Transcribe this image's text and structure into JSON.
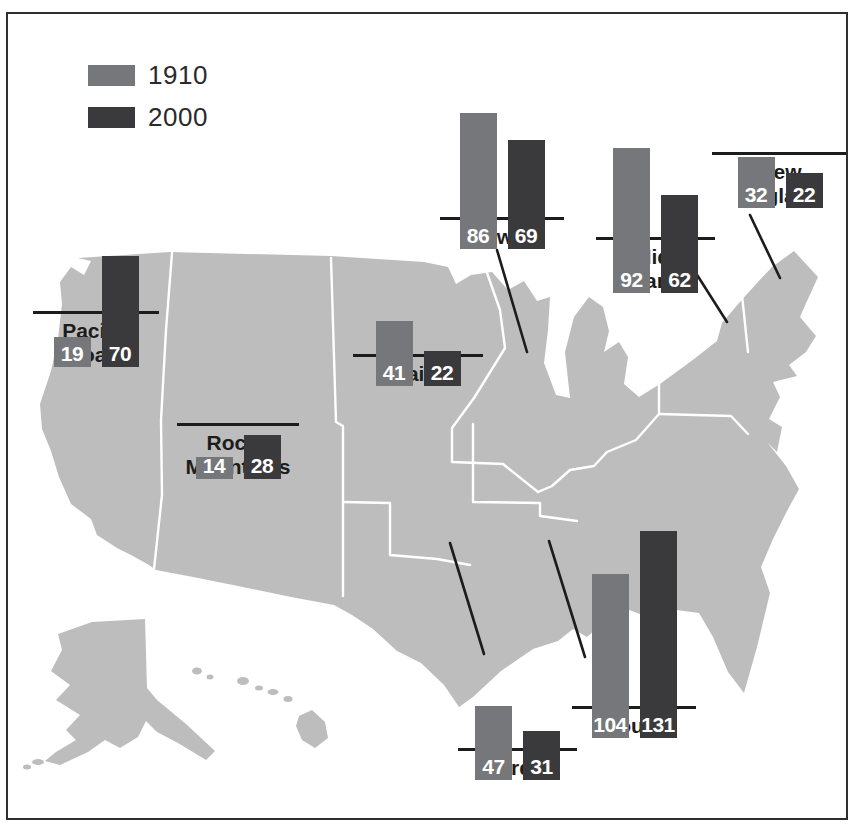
{
  "figure": {
    "kind": "us-regional-map-with-paired-bar-charts",
    "background_color": "#ffffff",
    "frame_color": "#2f2f31"
  },
  "legend": {
    "items": [
      {
        "label": "1910",
        "color": "#76777a"
      },
      {
        "label": "2000",
        "color": "#3a3a3c"
      }
    ]
  },
  "map": {
    "name": "united-states-map",
    "fill_color": "#bdbdbd",
    "region_border_color": "#ffffff",
    "callout_line_color": "#1c1c1c"
  },
  "regions": [
    {
      "id": "pacific",
      "label": "Pacific\nCoast",
      "v1910": 19,
      "v2000": 70
    },
    {
      "id": "rocky",
      "label": "Rocky\nMountains",
      "v1910": 14,
      "v2000": 28
    },
    {
      "id": "plains",
      "label": "Plains",
      "v1910": 41,
      "v2000": 22
    },
    {
      "id": "midwest",
      "label": "Midwest",
      "v1910": 86,
      "v2000": 69
    },
    {
      "id": "midatlantic",
      "label": "Mid-\nAtlantic",
      "v1910": 92,
      "v2000": 62
    },
    {
      "id": "newengland",
      "label": "New\nEngland",
      "v1910": 32,
      "v2000": 22
    },
    {
      "id": "border",
      "label": "Border",
      "v1910": 47,
      "v2000": 31
    },
    {
      "id": "south",
      "label": "South",
      "v1910": 104,
      "v2000": 131
    }
  ],
  "chart_data": {
    "type": "bar",
    "categories": [
      "Pacific Coast",
      "Rocky Mountains",
      "Plains",
      "Midwest",
      "Mid-Atlantic",
      "New England",
      "Border",
      "South"
    ],
    "series": [
      {
        "name": "1910",
        "values": [
          19,
          14,
          41,
          86,
          92,
          32,
          47,
          104
        ]
      },
      {
        "name": "2000",
        "values": [
          70,
          28,
          22,
          69,
          62,
          22,
          31,
          131
        ]
      }
    ],
    "colors": {
      "1910": "#76777a",
      "2000": "#3a3a3c"
    },
    "data_labels": "inside-bar-bottom-white",
    "legend_position": "top-left",
    "layout": "small multiples of paired bars placed over a gray US map with black callout lines to regions",
    "grid": false
  }
}
